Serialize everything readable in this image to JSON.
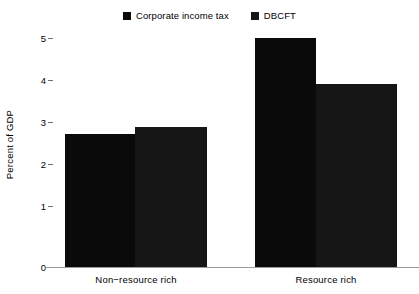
{
  "chart_data": {
    "type": "bar",
    "title": "",
    "xlabel": "",
    "ylabel": "Percent of GDP",
    "categories": [
      "Non−resource rich",
      "Resource rich"
    ],
    "series": [
      {
        "name": "Corporate income tax",
        "values": [
          2.9,
          5.0
        ],
        "color": "#0a0a0a"
      },
      {
        "name": "DBCFT",
        "values": [
          3.05,
          4.0
        ],
        "color": "#161616"
      }
    ],
    "ylim": [
      0,
      5
    ],
    "yticks": [
      "0",
      "1",
      "2",
      "3",
      "4",
      "5"
    ],
    "grid": false,
    "legend_position": "top-center"
  },
  "legend": {
    "entries": [
      {
        "label": "Corporate income tax",
        "swatch": "legend-swatch-corporate-income-tax"
      },
      {
        "label": "DBCFT",
        "swatch": "legend-swatch-dbcft"
      }
    ]
  },
  "axis": {
    "y_label": "Percent of GDP",
    "y_tick_5": "5",
    "y_tick_4": "4",
    "y_tick_3": "3",
    "y_tick_2": "2",
    "y_tick_1": "1",
    "y_tick_0": "0",
    "x_tick_0": "Non−resource rich",
    "x_tick_1": "Resource rich"
  },
  "colors": {
    "series_1": "#0a0a0a",
    "series_2": "#161616",
    "axis": "#9a9a9a",
    "background": "#ffffff"
  }
}
